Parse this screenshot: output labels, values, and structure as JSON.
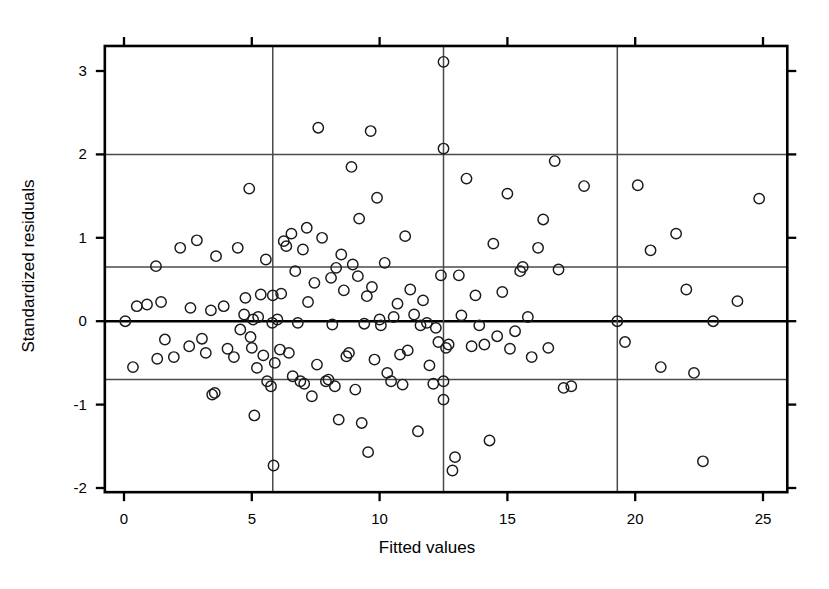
{
  "chart_data": {
    "type": "scatter",
    "title": "",
    "xlabel": "Fitted values",
    "ylabel": "Standardized residuals",
    "xlim": [
      -0.75,
      25.95
    ],
    "ylim": [
      -2.05,
      3.3
    ],
    "xticks": [
      0,
      5,
      10,
      15,
      20,
      25
    ],
    "xtick_labels": [
      "0",
      "5",
      "10",
      "15",
      "20",
      "25"
    ],
    "yticks": [
      3,
      2,
      1,
      0,
      -1,
      -2
    ],
    "ytick_labels": [
      "3",
      "2",
      "1",
      "0",
      "-1",
      "-2"
    ],
    "grid": false,
    "legend": null,
    "marker": "open-circle",
    "marker_color": "#1a1a1a",
    "marker_size": 5.2,
    "reference_lines": {
      "horizontal": [
        {
          "y": 2.0,
          "style": "thin"
        },
        {
          "y": 0.65,
          "style": "thin"
        },
        {
          "y": 0.0,
          "style": "thick"
        },
        {
          "y": -0.7,
          "style": "thin"
        }
      ],
      "vertical": [
        {
          "x": 5.82,
          "style": "thin"
        },
        {
          "x": 12.5,
          "style": "thin"
        },
        {
          "x": 19.3,
          "style": "thin"
        }
      ]
    },
    "n_points": 148,
    "points": [
      [
        0.05,
        0.0
      ],
      [
        0.35,
        -0.55
      ],
      [
        0.5,
        0.18
      ],
      [
        0.9,
        0.2
      ],
      [
        1.25,
        0.66
      ],
      [
        1.3,
        -0.45
      ],
      [
        1.45,
        0.23
      ],
      [
        1.6,
        -0.22
      ],
      [
        1.95,
        -0.43
      ],
      [
        2.2,
        0.88
      ],
      [
        2.55,
        -0.3
      ],
      [
        2.6,
        0.16
      ],
      [
        2.85,
        0.97
      ],
      [
        3.05,
        -0.21
      ],
      [
        3.2,
        -0.38
      ],
      [
        3.4,
        0.13
      ],
      [
        3.45,
        -0.88
      ],
      [
        3.55,
        -0.86
      ],
      [
        3.6,
        0.78
      ],
      [
        3.9,
        0.18
      ],
      [
        4.05,
        -0.33
      ],
      [
        4.3,
        -0.43
      ],
      [
        4.45,
        0.88
      ],
      [
        4.55,
        -0.1
      ],
      [
        4.7,
        0.08
      ],
      [
        4.75,
        0.28
      ],
      [
        4.9,
        1.59
      ],
      [
        4.95,
        -0.19
      ],
      [
        5.0,
        -0.32
      ],
      [
        5.05,
        0.02
      ],
      [
        5.1,
        -1.13
      ],
      [
        5.2,
        -0.56
      ],
      [
        5.25,
        0.05
      ],
      [
        5.35,
        0.32
      ],
      [
        5.45,
        -0.41
      ],
      [
        5.55,
        0.74
      ],
      [
        5.6,
        -0.72
      ],
      [
        5.75,
        -0.78
      ],
      [
        5.8,
        -0.02
      ],
      [
        5.82,
        0.31
      ],
      [
        5.85,
        -1.73
      ],
      [
        5.9,
        -0.5
      ],
      [
        6.0,
        0.02
      ],
      [
        6.1,
        -0.34
      ],
      [
        6.15,
        0.33
      ],
      [
        6.25,
        0.96
      ],
      [
        6.35,
        0.9
      ],
      [
        6.45,
        -0.38
      ],
      [
        6.55,
        1.05
      ],
      [
        6.6,
        -0.66
      ],
      [
        6.7,
        0.6
      ],
      [
        6.8,
        -0.02
      ],
      [
        6.9,
        -0.72
      ],
      [
        7.0,
        0.86
      ],
      [
        7.05,
        -0.75
      ],
      [
        7.15,
        1.12
      ],
      [
        7.2,
        0.23
      ],
      [
        7.35,
        -0.9
      ],
      [
        7.45,
        0.46
      ],
      [
        7.55,
        -0.52
      ],
      [
        7.6,
        2.32
      ],
      [
        7.75,
        1.0
      ],
      [
        7.9,
        -0.72
      ],
      [
        8.0,
        -0.7
      ],
      [
        8.1,
        0.52
      ],
      [
        8.15,
        -0.04
      ],
      [
        8.25,
        -0.78
      ],
      [
        8.3,
        0.64
      ],
      [
        8.4,
        -1.18
      ],
      [
        8.5,
        0.8
      ],
      [
        8.6,
        0.37
      ],
      [
        8.7,
        -0.42
      ],
      [
        8.8,
        -0.38
      ],
      [
        8.9,
        1.85
      ],
      [
        8.95,
        0.68
      ],
      [
        9.05,
        -0.82
      ],
      [
        9.15,
        0.54
      ],
      [
        9.2,
        1.23
      ],
      [
        9.3,
        -1.22
      ],
      [
        9.4,
        -0.03
      ],
      [
        9.5,
        0.3
      ],
      [
        9.55,
        -1.57
      ],
      [
        9.65,
        2.28
      ],
      [
        9.7,
        0.41
      ],
      [
        9.8,
        -0.46
      ],
      [
        9.9,
        1.48
      ],
      [
        10.0,
        0.02
      ],
      [
        10.05,
        -0.05
      ],
      [
        10.2,
        0.7
      ],
      [
        10.3,
        -0.62
      ],
      [
        10.45,
        -0.72
      ],
      [
        10.55,
        0.05
      ],
      [
        10.7,
        0.21
      ],
      [
        10.8,
        -0.4
      ],
      [
        10.9,
        -0.76
      ],
      [
        11.0,
        1.02
      ],
      [
        11.1,
        -0.35
      ],
      [
        11.2,
        0.38
      ],
      [
        11.35,
        0.08
      ],
      [
        11.5,
        -1.32
      ],
      [
        11.6,
        -0.05
      ],
      [
        11.7,
        0.25
      ],
      [
        11.85,
        -0.02
      ],
      [
        11.95,
        -0.53
      ],
      [
        12.1,
        -0.75
      ],
      [
        12.2,
        -0.08
      ],
      [
        12.3,
        -0.25
      ],
      [
        12.4,
        0.55
      ],
      [
        12.5,
        3.11
      ],
      [
        12.5,
        2.07
      ],
      [
        12.5,
        -0.72
      ],
      [
        12.5,
        -0.94
      ],
      [
        12.6,
        -0.32
      ],
      [
        12.7,
        -0.28
      ],
      [
        12.85,
        -1.79
      ],
      [
        12.95,
        -1.63
      ],
      [
        13.1,
        0.55
      ],
      [
        13.2,
        0.07
      ],
      [
        13.4,
        1.71
      ],
      [
        13.6,
        -0.3
      ],
      [
        13.75,
        0.31
      ],
      [
        13.9,
        -0.05
      ],
      [
        14.1,
        -0.28
      ],
      [
        14.3,
        -1.43
      ],
      [
        14.45,
        0.93
      ],
      [
        14.6,
        -0.18
      ],
      [
        14.8,
        0.35
      ],
      [
        15.0,
        1.53
      ],
      [
        15.1,
        -0.33
      ],
      [
        15.3,
        -0.12
      ],
      [
        15.5,
        0.6
      ],
      [
        15.6,
        0.65
      ],
      [
        15.8,
        0.05
      ],
      [
        15.95,
        -0.43
      ],
      [
        16.2,
        0.88
      ],
      [
        16.4,
        1.22
      ],
      [
        16.6,
        -0.32
      ],
      [
        16.85,
        1.92
      ],
      [
        17.0,
        0.62
      ],
      [
        17.2,
        -0.8
      ],
      [
        17.5,
        -0.78
      ],
      [
        18.0,
        1.62
      ],
      [
        19.3,
        0.0
      ],
      [
        19.6,
        -0.25
      ],
      [
        20.1,
        1.63
      ],
      [
        20.6,
        0.85
      ],
      [
        21.0,
        -0.55
      ],
      [
        21.6,
        1.05
      ],
      [
        22.0,
        0.38
      ],
      [
        22.3,
        -0.62
      ],
      [
        22.65,
        -1.68
      ],
      [
        23.05,
        0.0
      ],
      [
        24.0,
        0.24
      ],
      [
        24.85,
        1.47
      ]
    ]
  },
  "axes": {
    "x_axis_name": "x-axis",
    "y_axis_name": "y-axis"
  }
}
